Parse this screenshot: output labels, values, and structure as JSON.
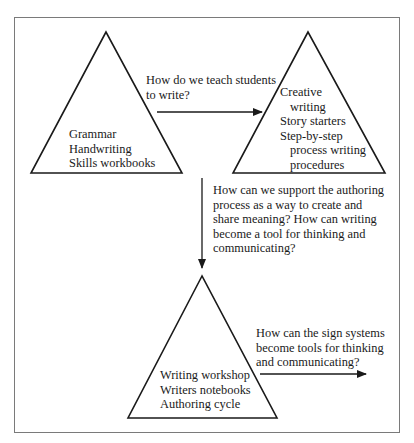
{
  "diagram": {
    "triangles": [
      {
        "id": "traditional",
        "lines": [
          "Grammar",
          "Handwriting",
          "Skills workbooks"
        ]
      },
      {
        "id": "process",
        "lines": [
          "Creative",
          "writing",
          "Story starters",
          "Step-by-step",
          "process writing",
          "procedures"
        ]
      },
      {
        "id": "authoring",
        "lines": [
          "Writing workshop",
          "Writers notebooks",
          "Authoring cycle"
        ]
      }
    ],
    "questions": [
      {
        "id": "q1",
        "lines": [
          "How do we teach students",
          "to write?"
        ]
      },
      {
        "id": "q2",
        "lines": [
          "How can we support the authoring",
          "process as a way to create and",
          "share meaning?  How can writing",
          "become a tool for thinking and",
          "communicating?"
        ]
      },
      {
        "id": "q3",
        "lines": [
          "How can the sign systems",
          "become tools for thinking",
          "and communicating?"
        ]
      }
    ],
    "arrows": [
      {
        "id": "arrow-1",
        "direction": "right",
        "from": "traditional",
        "to": "process"
      },
      {
        "id": "arrow-2",
        "direction": "down",
        "from": "process",
        "to": "authoring"
      },
      {
        "id": "arrow-3",
        "direction": "right",
        "from": "authoring",
        "to": "beyond"
      }
    ],
    "colors": {
      "stroke": "#1a1a1a",
      "frame": "#7a7a7a",
      "background": "#ffffff"
    }
  }
}
